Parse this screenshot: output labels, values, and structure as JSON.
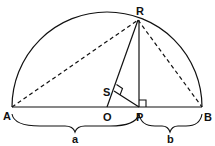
{
  "diagram": {
    "points": {
      "A": "A",
      "B": "B",
      "O": "O",
      "P": "P",
      "R": "R",
      "S": "S"
    },
    "segments": {
      "a": "a",
      "b": "b"
    },
    "colors": {
      "stroke": "#111111",
      "background": "#ffffff"
    }
  }
}
